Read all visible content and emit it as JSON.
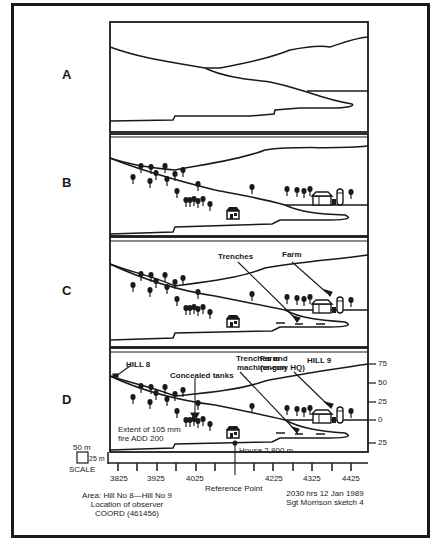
{
  "panels": [
    {
      "id": "A",
      "label": "A"
    },
    {
      "id": "B",
      "label": "B"
    },
    {
      "id": "C",
      "label": "C"
    },
    {
      "id": "D",
      "label": "D"
    }
  ],
  "annotations": {
    "panel_c": {
      "trenches": "Trenches",
      "farm": "Farm"
    },
    "panel_d": {
      "hill_8": "HILL 8",
      "trenches_mg_line1": "Trenches and",
      "trenches_mg_line2": "machine-gun",
      "farm_line1": "Farm",
      "farm_line2": "(enemy HQ)",
      "hill_9": "HILL 9",
      "concealed_tanks": "Concealed tanks",
      "extent_line1": "Extent of 105 mm",
      "extent_line2": "fire ADD 200",
      "house": "House 2,800 m"
    }
  },
  "right_scale": {
    "ticks": [
      "75",
      "50",
      "25",
      "0",
      "25"
    ]
  },
  "scale_key": {
    "width_label": "50 m",
    "height_label": "25 m",
    "title": "SCALE"
  },
  "x_axis": {
    "ticks": [
      "3825",
      "3925",
      "4025",
      "4225",
      "4325",
      "4425"
    ],
    "reference_label": "Reference Point"
  },
  "footer_left": {
    "line1": "Area: Hill No 8—Hill No 9",
    "line2": "Location of observer",
    "line3": "COORD (461456)"
  },
  "footer_right": {
    "line1": "2030 hrs   12 Jan 1989",
    "line2": "Sgt Morrison sketch 4"
  },
  "colors": {
    "ink": "#1a1a1a",
    "paper": "#ffffff"
  }
}
